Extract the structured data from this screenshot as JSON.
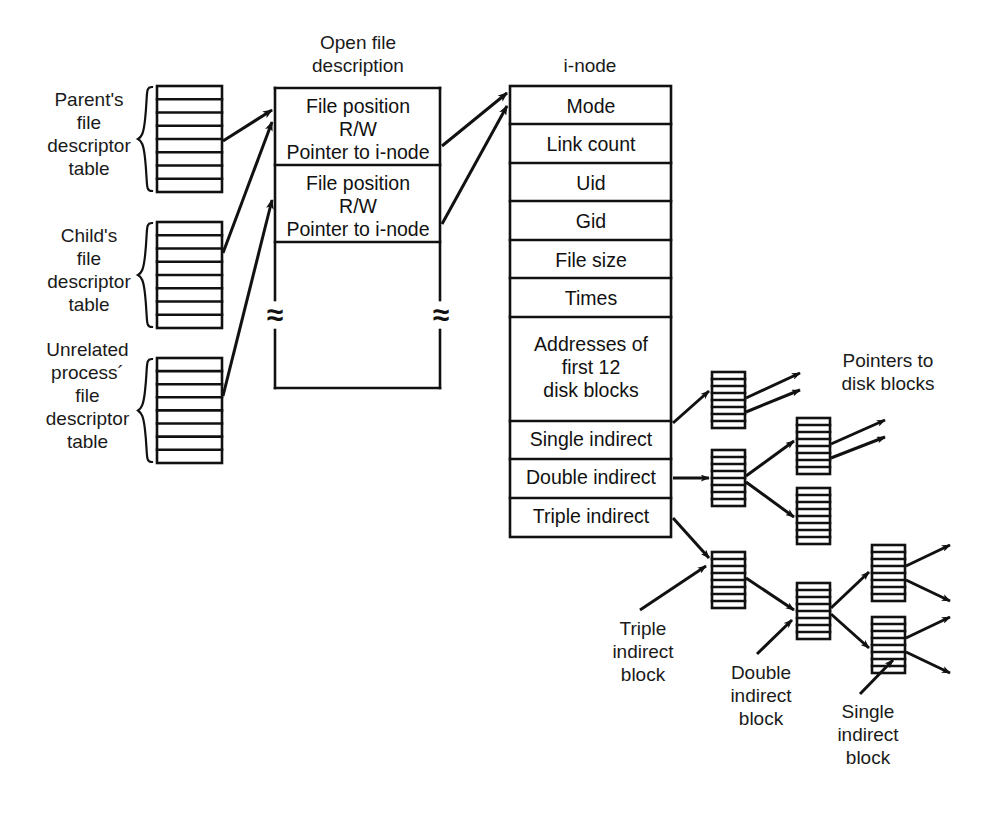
{
  "diagram": {
    "headings": {
      "open_file_description": "Open file\ndescription",
      "inode": "i-node",
      "pointers_to_disk_blocks": "Pointers to\ndisk blocks"
    },
    "fd_tables": [
      {
        "label": "Parent's\nfile\ndescriptor\ntable",
        "rows": 8
      },
      {
        "label": "Child's\nfile\ndescriptor\ntable",
        "rows": 8
      },
      {
        "label": "Unrelated\nprocess´\nfile\ndescriptor\ntable",
        "rows": 8
      }
    ],
    "open_file_entries": [
      {
        "line1": "File position",
        "line2": "R/W",
        "line3": "Pointer to i-node"
      },
      {
        "line1": "File position",
        "line2": "R/W",
        "line3": "Pointer to i-node"
      }
    ],
    "break_mark": "≈",
    "inode_rows": [
      "Mode",
      "Link count",
      "Uid",
      "Gid",
      "File size",
      "Times",
      "Addresses of\nfirst 12\ndisk blocks",
      "Single indirect",
      "Double indirect",
      "Triple indirect"
    ],
    "block_callouts": [
      "Triple\nindirect\nblock",
      "Double\nindirect\nblock",
      "Single\nindirect\nblock"
    ],
    "colors": {
      "stroke": "#111111",
      "text": "#1a1a1a",
      "background": "#ffffff"
    }
  }
}
